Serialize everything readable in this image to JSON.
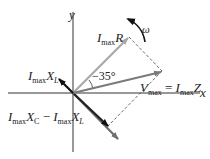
{
  "diagram": {
    "type": "phasor-diagram",
    "axes": {
      "x_label": "x",
      "y_label": "y"
    },
    "rotation_label": "ω",
    "angle_label": "−35°",
    "phasors": [
      {
        "id": "resistor",
        "label_main": "I",
        "label_sub": "max",
        "label_tail": "R",
        "color": "#a8a8a8"
      },
      {
        "id": "total",
        "label_main": "V",
        "label_sub": "max",
        "equals": "=",
        "rhs_main": "I",
        "rhs_sub": "max",
        "rhs_tail": "Z",
        "color": "#7a7a7a"
      },
      {
        "id": "inductor",
        "label_main": "I",
        "label_sub": "max",
        "label_tail": "X",
        "label_tail_sub": "L",
        "color": "#111111"
      },
      {
        "id": "capacitor-minus-inductor",
        "label_a_main": "I",
        "label_a_sub": "max",
        "label_a_tail": "X",
        "label_a_tail_sub": "C",
        "minus": "−",
        "label_b_main": "I",
        "label_b_sub": "max",
        "label_b_tail": "X",
        "label_b_tail_sub": "L",
        "color": "#6e6e6e"
      }
    ],
    "colors": {
      "axis": "#333333",
      "dashed": "#444444",
      "resistor": "#a8a8a8",
      "total": "#7a7a7a",
      "inductor": "#111111",
      "capacitor": "#6e6e6e"
    }
  }
}
